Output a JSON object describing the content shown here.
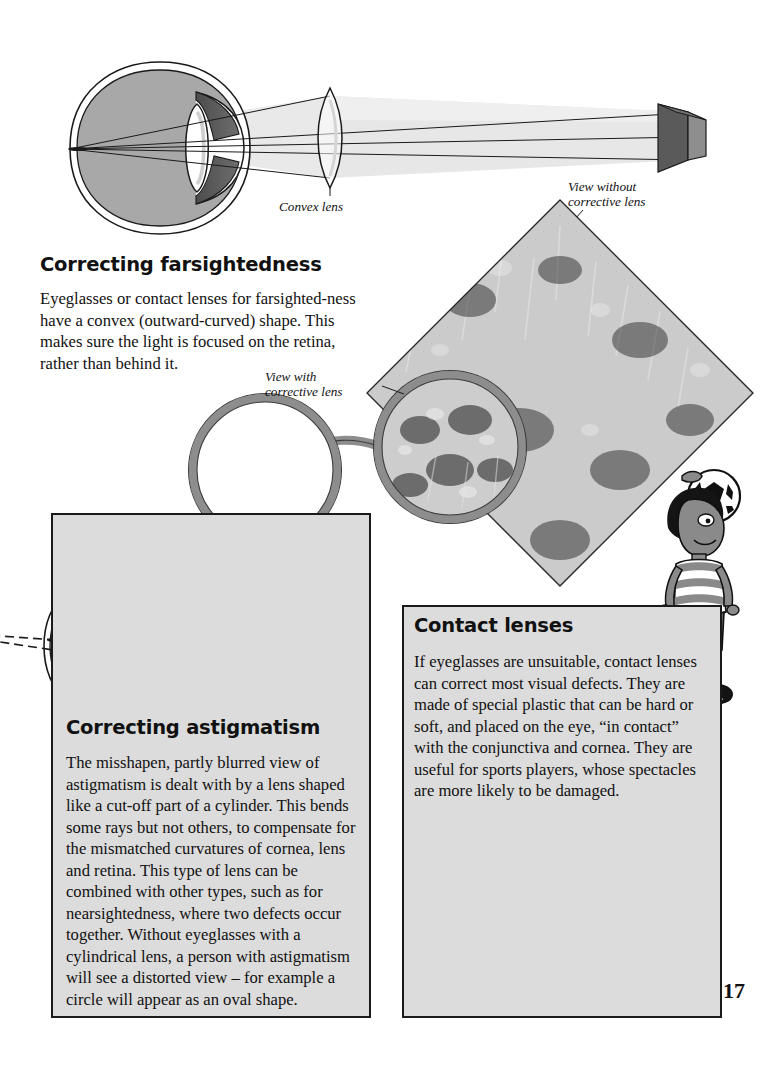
{
  "page": {
    "number": "17",
    "background": "#ffffff",
    "panel_fill": "#dcdcdc",
    "ink": "#111111"
  },
  "sections": [
    {
      "id": "correcting-farsightedness",
      "heading": "Correcting farsightedness",
      "body": "Eyeglasses or contact lenses for farsighted-ness have a convex (outward-curved) shape. This makes sure the light is focused on the retina, rather than behind it."
    },
    {
      "id": "correcting-astigmatism",
      "heading": "Correcting astigmatism",
      "body": "The misshapen, partly blurred view of astigmatism is dealt with by a lens shaped like a cut-off part of a cylinder. This bends some rays but not others, to compensate for the mismatched curvatures of cornea, lens and retina. This type of lens can be combined with other types, such as for nearsightedness, where two defects occur together. Without eyeglasses with a cylindrical lens, a person with astigmatism will see a distorted view – for example a circle will appear as an oval shape."
    },
    {
      "id": "contact-lenses",
      "heading": "Contact lenses",
      "body": "If eyeglasses are unsuitable, contact lenses can correct most visual defects. They are made of special plastic that can be hard or soft, and placed on the eye, “in contact” with the conjunctiva and cornea. They are useful for sports players, whose spectacles are more likely to be damaged."
    }
  ],
  "captions": {
    "convex_lens": "Convex lens",
    "view_without": "View without\ncorrective lens",
    "view_without_line1": "View without",
    "view_without_line2": "corrective lens",
    "view_with_line1": "View with",
    "view_with_line2": "corrective lens"
  },
  "figures": {
    "farsight_diagram": {
      "name": "farsighted-eye-with-convex-lens-diagram",
      "parts": [
        "eyeball",
        "sclera",
        "iris",
        "crystalline-lens",
        "light-rays",
        "convex-lens",
        "distant-object-prism"
      ]
    },
    "astigmatism_diagram": {
      "name": "astigmatic-eye-with-cylindrical-lens-diagram",
      "parts": [
        "eyeball",
        "sclera",
        "iris",
        "crystalline-lens",
        "light-rays",
        "cylindrical-lens"
      ]
    },
    "eyeglasses": {
      "name": "eyeglasses-frame",
      "parts": [
        "left-rim",
        "bridge",
        "right-rim-showing-corrected-view"
      ]
    },
    "flower_photo": {
      "name": "flower-garden-photo-diamond",
      "description": "grayscale photograph of a flower bed rotated 45 degrees"
    },
    "eye_photo": {
      "name": "eye-with-contact-lens-photo",
      "description": "grayscale close-up photograph of a human eye wearing a contact lens"
    },
    "boy": {
      "name": "cartoon-boy-with-soccer-ball",
      "description": "illustration of a boy balancing a soccer ball on his head"
    }
  }
}
